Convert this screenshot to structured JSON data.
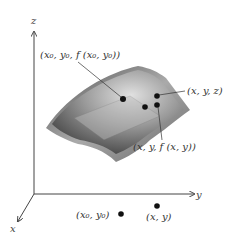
{
  "diagram": {
    "axes": {
      "z_label": "z",
      "y_label": "y",
      "x_label": "x"
    },
    "labels": {
      "point_on_surface_0": "(x₀, y₀, f (x₀, y₀))",
      "point_xyz": "(x, y, z)",
      "point_on_surface": "(x, y, f (x, y))",
      "domain_point_0": "(x₀, y₀)",
      "domain_point": "(x, y)"
    },
    "colors": {
      "surface_dark": "#3a3a3a",
      "surface_mid": "#8a8a8a",
      "surface_light": "#d8d8d8",
      "axis": "#444444",
      "point": "#111111"
    }
  }
}
